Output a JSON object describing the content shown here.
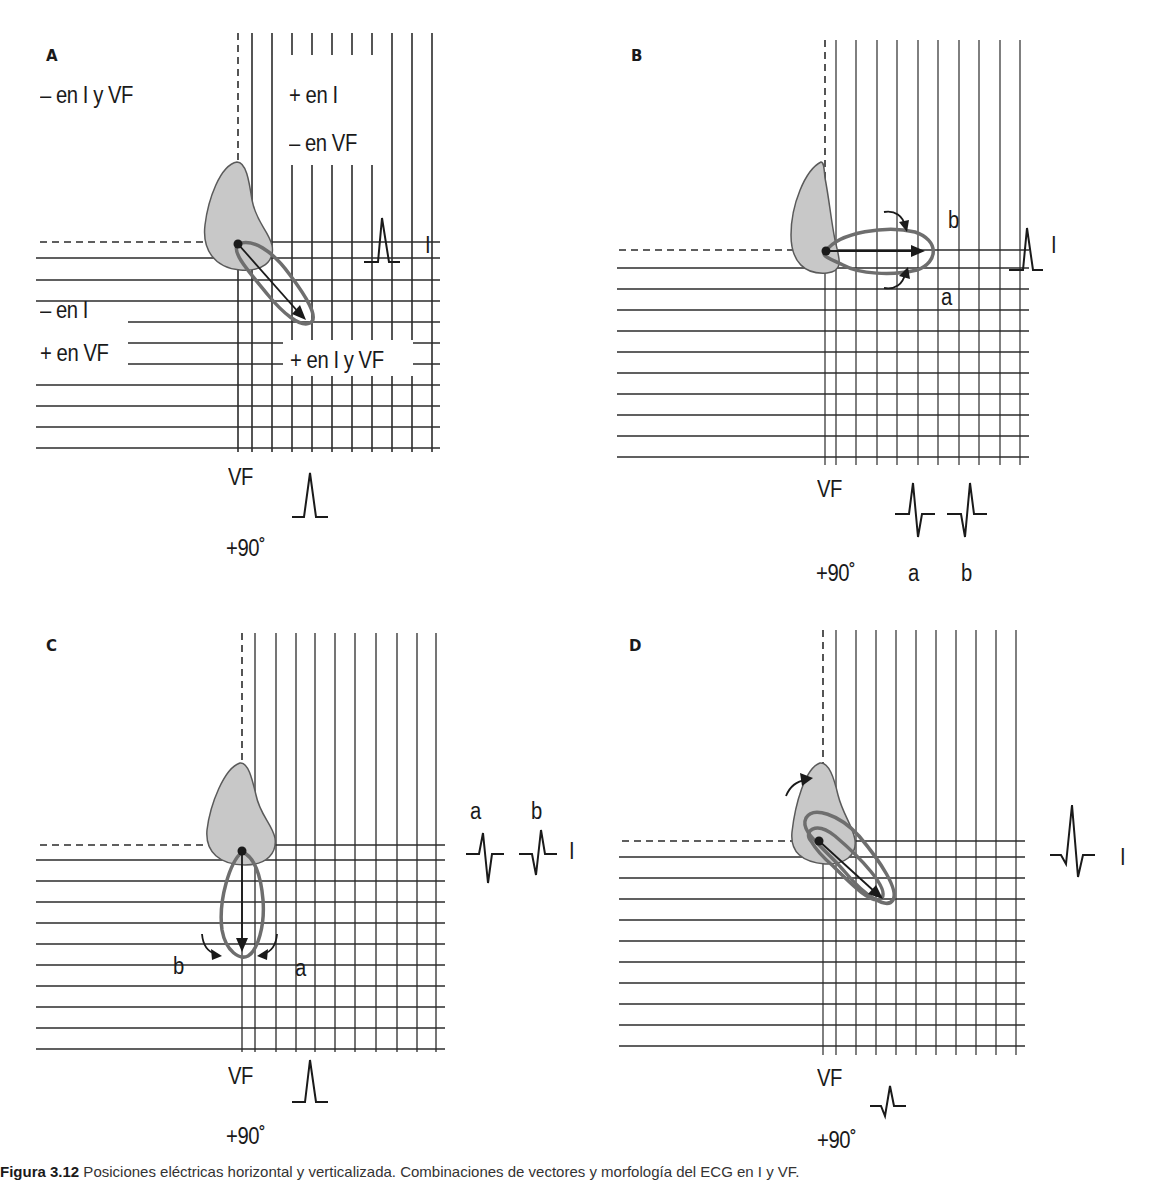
{
  "figure": {
    "caption_label": "Figura 3.12",
    "caption_text": " Posiciones eléctricas horizontal y verticalizada. Combinaciones de vectores y morfología del ECG en I y VF."
  },
  "panels": [
    {
      "id": "A",
      "letter": "A",
      "quadrant_labels": {
        "upper_left": "– en I y VF",
        "upper_right_1": "+ en I",
        "upper_right_2": "– en VF",
        "lower_left_1": "– en I",
        "lower_left_2": "+ en VF",
        "lower_right": "+ en I y VF"
      },
      "lead_I_label": "I",
      "lead_VF_label": "VF",
      "angle_label": "+90˚",
      "lead_I_morphology": "positive",
      "lead_VF_morphology": "positive",
      "vector_direction": "inferior-right (approx +45˚)"
    },
    {
      "id": "B",
      "letter": "B",
      "lead_I_label": "I",
      "lead_VF_label": "VF",
      "angle_label": "+90˚",
      "loop_labels": {
        "a": "a",
        "b": "b"
      },
      "vf_complex_labels": [
        "a",
        "b"
      ],
      "lead_I_morphology": "positive",
      "lead_VF_morphology": [
        "rS (a)",
        "qR (b)"
      ],
      "vector_direction": "horizontal (0˚)"
    },
    {
      "id": "C",
      "letter": "C",
      "lead_I_label": "I",
      "lead_VF_label": "VF",
      "angle_label": "+90˚",
      "loop_labels": {
        "a": "a",
        "b": "b"
      },
      "lead_I_complex_labels": [
        "a",
        "b"
      ],
      "lead_I_morphology": [
        "rS (a)",
        "qR (b)"
      ],
      "lead_VF_morphology": "positive",
      "vector_direction": "vertical (+90˚)"
    },
    {
      "id": "D",
      "letter": "D",
      "lead_I_label": "I",
      "lead_VF_label": "VF",
      "angle_label": "+90˚",
      "lead_I_morphology": "qRs",
      "lead_VF_morphology": "qR",
      "vector_direction": "inferior-right (approx +45˚)"
    }
  ],
  "colors": {
    "grid": "#2b2b2b",
    "heart_fill": "#c8c8c8",
    "heart_stroke": "#5a5a5a",
    "loop_stroke": "#6e6e6e",
    "vector": "#1a1a1a"
  }
}
